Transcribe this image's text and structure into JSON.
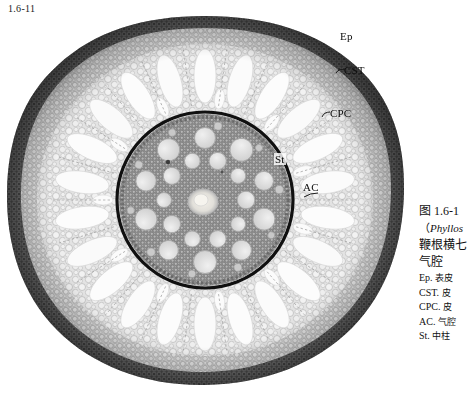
{
  "figure": {
    "number": "1.6-11"
  },
  "callouts": [
    {
      "id": "ep",
      "text": "Ep",
      "meaning": "epidermis"
    },
    {
      "id": "cst",
      "text": "CST",
      "meaning": "cortical-sclerenchyma-tissue"
    },
    {
      "id": "cpc",
      "text": "CPC",
      "meaning": "cortical-parenchyma-cell"
    },
    {
      "id": "st",
      "text": "St",
      "meaning": "stele"
    },
    {
      "id": "ac",
      "text": "AC",
      "meaning": "air-cavity"
    }
  ],
  "caption": {
    "title": "图 1.6-1",
    "scientific_prefix": "（",
    "scientific_name": "Phyllos",
    "line_cn_1": "鞭根横七",
    "line_cn_2": "气腔",
    "abbreviations": [
      {
        "code": "Ep.",
        "term": "表皮"
      },
      {
        "code": "CST.",
        "term": "皮"
      },
      {
        "code": "CPC.",
        "term": "皮"
      },
      {
        "code": "AC.",
        "term": "气腔"
      },
      {
        "code": "St.",
        "term": "中柱"
      }
    ]
  },
  "micrograph": {
    "type": "plant-root-cross-section",
    "colors": {
      "background": "#ffffff",
      "epidermis_rim": "#5d5d5d",
      "outer_cortex": "#9a9a9a",
      "cortex_parenchyma": "#d9d9d9",
      "air_cavity": "#fbfbfb",
      "endodermis_ring": "#121212",
      "stele_ground": "#8d8d8d",
      "vessel": "#dcdcdc",
      "pith": "#ededed"
    },
    "geometry": {
      "center_x": 205,
      "center_y": 190,
      "outer_radius_x": 200,
      "outer_radius_y": 186,
      "stele_radius": 88,
      "air_cavity_count": 22,
      "large_vessel_count": 20
    }
  }
}
